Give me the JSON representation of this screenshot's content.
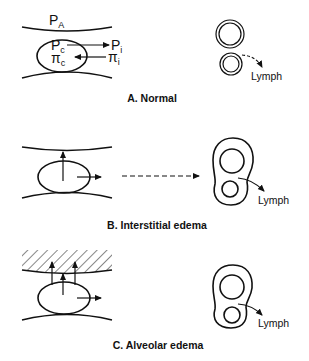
{
  "panels": [
    {
      "id": "A",
      "caption": "A. Normal",
      "labels": {
        "alveolar_pressure": "P",
        "alveolar_pressure_sub": "A",
        "capillary_pressure": "P",
        "capillary_pressure_sub": "c",
        "interstitial_pressure": "P",
        "interstitial_pressure_sub": "i",
        "capillary_oncotic": "π",
        "capillary_oncotic_sub": "c",
        "interstitial_oncotic": "π",
        "interstitial_oncotic_sub": "i",
        "lymph": "Lymph"
      }
    },
    {
      "id": "B",
      "caption": "B. Interstitial edema",
      "labels": {
        "lymph": "Lymph"
      }
    },
    {
      "id": "C",
      "caption": "C. Alveolar edema",
      "labels": {
        "lymph": "Lymph"
      }
    }
  ],
  "colors": {
    "stroke": "#111111",
    "background": "#ffffff"
  }
}
